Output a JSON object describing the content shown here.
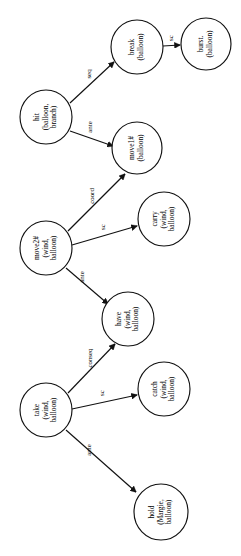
{
  "diagram": {
    "type": "directed-graph",
    "orientation": "rotated-90-ccw",
    "nodes": [
      {
        "id": "hit",
        "label_lines": [
          "hit",
          "(balloon,",
          "branch)"
        ],
        "cx": 46,
        "cy": 117,
        "rx": 26,
        "ry": 27
      },
      {
        "id": "break",
        "label_lines": [
          "break",
          "(balloon)"
        ],
        "cx": 137,
        "cy": 47,
        "rx": 26,
        "ry": 27
      },
      {
        "id": "burst",
        "label_lines": [
          "burst.",
          "(balloon)"
        ],
        "cx": 206,
        "cy": 44,
        "rx": 25,
        "ry": 26
      },
      {
        "id": "move1",
        "label_lines": [
          "move1#",
          "(balloon)"
        ],
        "cx": 137,
        "cy": 148,
        "rx": 25,
        "ry": 26
      },
      {
        "id": "move2",
        "label_lines": [
          "move2#",
          "(wind,",
          "balloon)"
        ],
        "cx": 46,
        "cy": 248,
        "rx": 26,
        "ry": 27
      },
      {
        "id": "carry",
        "label_lines": [
          "carry",
          "(wind,",
          "balloon)"
        ],
        "cx": 164,
        "cy": 219,
        "rx": 26,
        "ry": 27
      },
      {
        "id": "have",
        "label_lines": [
          "have",
          "(wind,",
          "balloon)"
        ],
        "cx": 128,
        "cy": 319,
        "rx": 26,
        "ry": 27
      },
      {
        "id": "take",
        "label_lines": [
          "take",
          "(wind,",
          "balloon)"
        ],
        "cx": 46,
        "cy": 410,
        "rx": 26,
        "ry": 27
      },
      {
        "id": "catch",
        "label_lines": [
          "catch",
          "(wind,",
          "balloon)"
        ],
        "cx": 164,
        "cy": 389,
        "rx": 26,
        "ry": 27
      },
      {
        "id": "hold",
        "label_lines": [
          "hold",
          "(Margie,",
          "balloon)"
        ],
        "cx": 161,
        "cy": 512,
        "rx": 27,
        "ry": 28
      }
    ],
    "edges": [
      {
        "from": "hit",
        "to": "break",
        "label": "seq",
        "x1": 70,
        "y1": 103,
        "x2": 114,
        "y2": 62,
        "lx": 89,
        "ly": 74
      },
      {
        "from": "hit",
        "to": "move1",
        "label": "ante",
        "x1": 70,
        "y1": 131,
        "x2": 113,
        "y2": 146,
        "lx": 90,
        "ly": 127
      },
      {
        "from": "break",
        "to": "burst",
        "label": "sc",
        "x1": 163,
        "y1": 46,
        "x2": 180,
        "y2": 45,
        "lx": 171,
        "ly": 38
      },
      {
        "from": "move2",
        "to": "move1",
        "label": "coord",
        "x1": 68,
        "y1": 231,
        "x2": 125,
        "y2": 174,
        "lx": 92,
        "ly": 196
      },
      {
        "from": "move2",
        "to": "carry",
        "label": "sc",
        "x1": 72,
        "y1": 245,
        "x2": 137,
        "y2": 226,
        "lx": 103,
        "ly": 227
      },
      {
        "from": "move2",
        "to": "have",
        "label": "ante",
        "x1": 66,
        "y1": 268,
        "x2": 108,
        "y2": 304,
        "lx": 82,
        "ly": 277
      },
      {
        "from": "take",
        "to": "have",
        "label": "conseq",
        "x1": 68,
        "y1": 393,
        "x2": 115,
        "y2": 344,
        "lx": 90,
        "ly": 358
      },
      {
        "from": "take",
        "to": "catch",
        "label": "sc",
        "x1": 72,
        "y1": 409,
        "x2": 137,
        "y2": 395,
        "lx": 102,
        "ly": 393
      },
      {
        "from": "take",
        "to": "hold",
        "label": "ante",
        "x1": 66,
        "y1": 430,
        "x2": 136,
        "y2": 492,
        "lx": 89,
        "ly": 450
      }
    ],
    "colors": {
      "node_fill": "#ffffff",
      "stroke": "#111111",
      "text": "#000000",
      "background": "#ffffff"
    }
  }
}
